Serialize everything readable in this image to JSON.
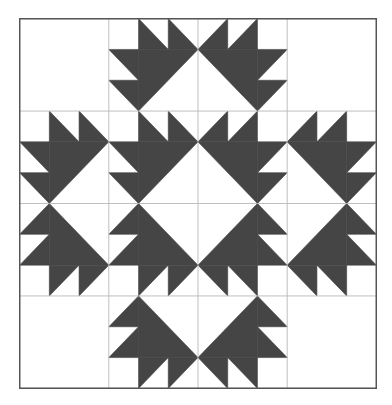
{
  "diagram": {
    "type": "quilt-block",
    "grid": {
      "cols": 4,
      "rows": 4,
      "subdivisions_per_cell": 3
    },
    "colors": {
      "background": "#ffffff",
      "fill": "#454545",
      "grid_line": "#b8b8b8",
      "border": "#555555"
    },
    "layout": [
      [
        "empty",
        "A",
        "B",
        "empty"
      ],
      [
        "A",
        "A",
        "B",
        "B"
      ],
      [
        "C",
        "C",
        "D",
        "D"
      ],
      [
        "empty",
        "C",
        "D",
        "empty"
      ]
    ],
    "cell_types": {
      "A": [
        [
          [
            1,
            0
          ],
          [
            1,
            1
          ],
          [
            2,
            1
          ]
        ],
        [
          [
            2,
            0
          ],
          [
            2,
            1
          ],
          [
            3,
            1
          ]
        ],
        [
          [
            0,
            1
          ],
          [
            1,
            1
          ],
          [
            1,
            2
          ]
        ],
        [
          [
            0,
            2
          ],
          [
            1,
            2
          ],
          [
            1,
            3
          ]
        ],
        [
          [
            1,
            1
          ],
          [
            3,
            1
          ],
          [
            1,
            3
          ]
        ]
      ],
      "B": [
        [
          [
            2,
            0
          ],
          [
            2,
            1
          ],
          [
            1,
            1
          ]
        ],
        [
          [
            1,
            0
          ],
          [
            1,
            1
          ],
          [
            0,
            1
          ]
        ],
        [
          [
            3,
            1
          ],
          [
            2,
            1
          ],
          [
            2,
            2
          ]
        ],
        [
          [
            3,
            2
          ],
          [
            2,
            2
          ],
          [
            2,
            3
          ]
        ],
        [
          [
            2,
            1
          ],
          [
            0,
            1
          ],
          [
            2,
            3
          ]
        ]
      ],
      "C": [
        [
          [
            1,
            3
          ],
          [
            1,
            2
          ],
          [
            2,
            2
          ]
        ],
        [
          [
            2,
            3
          ],
          [
            2,
            2
          ],
          [
            3,
            2
          ]
        ],
        [
          [
            0,
            2
          ],
          [
            1,
            2
          ],
          [
            1,
            1
          ]
        ],
        [
          [
            0,
            1
          ],
          [
            1,
            1
          ],
          [
            1,
            0
          ]
        ],
        [
          [
            1,
            2
          ],
          [
            3,
            2
          ],
          [
            1,
            0
          ]
        ]
      ],
      "D": [
        [
          [
            2,
            3
          ],
          [
            2,
            2
          ],
          [
            1,
            2
          ]
        ],
        [
          [
            1,
            3
          ],
          [
            1,
            2
          ],
          [
            0,
            2
          ]
        ],
        [
          [
            3,
            2
          ],
          [
            2,
            2
          ],
          [
            2,
            1
          ]
        ],
        [
          [
            3,
            1
          ],
          [
            2,
            1
          ],
          [
            2,
            0
          ]
        ],
        [
          [
            2,
            2
          ],
          [
            0,
            2
          ],
          [
            2,
            0
          ]
        ]
      ],
      "empty": []
    }
  }
}
